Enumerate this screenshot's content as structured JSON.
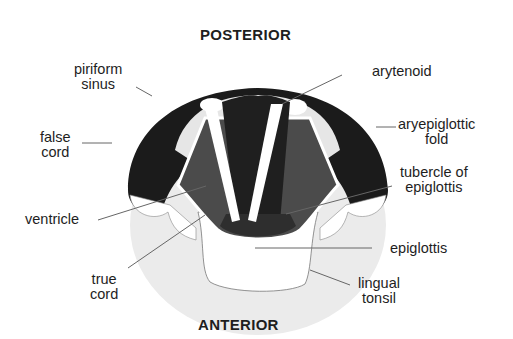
{
  "diagram": {
    "title_top": "POSTERIOR",
    "title_bottom": "ANTERIOR",
    "labels": {
      "piriform_sinus": [
        "piriform",
        "sinus"
      ],
      "false_cord": [
        "false",
        "cord"
      ],
      "ventricle": [
        "ventricle"
      ],
      "true_cord": [
        "true",
        "cord"
      ],
      "arytenoid": [
        "arytenoid"
      ],
      "aryepiglottic_fold": [
        "aryepiglottic",
        "fold"
      ],
      "tubercle_of_epiglottis": [
        "tubercle of",
        "epiglottis"
      ],
      "epiglottis": [
        "epiglottis"
      ],
      "lingual_tonsil": [
        "lingual",
        "tonsil"
      ]
    },
    "colors": {
      "dark_fold": "#1a1a1a",
      "inner_dark": "#2e2e2e",
      "mid_gray": "#4a4a4a",
      "light_gray": "#e8e8e8",
      "tonsil_gray": "#ececec",
      "white": "#ffffff",
      "line": "#555555"
    }
  }
}
